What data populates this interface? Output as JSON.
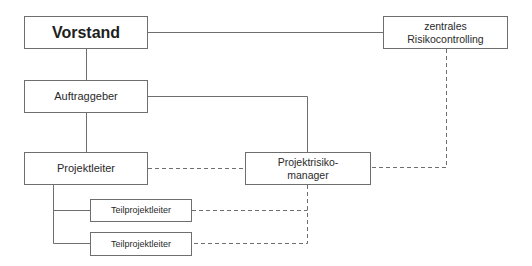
{
  "diagram": {
    "type": "organization-chart",
    "nodes": {
      "vorstand": {
        "label": "Vorstand"
      },
      "zentrales_risikocontrolling": {
        "line1": "zentrales",
        "line2": "Risikocontrolling"
      },
      "auftraggeber": {
        "label": "Auftraggeber"
      },
      "projektleiter": {
        "label": "Projektleiter"
      },
      "projektrisikomanager": {
        "line1": "Projektrisiko-",
        "line2": "manager"
      },
      "teilprojektleiter_1": {
        "label": "Teilprojektleiter"
      },
      "teilprojektleiter_2": {
        "label": "Teilprojektleiter"
      }
    },
    "edges": [
      {
        "from": "vorstand",
        "to": "zentrales_risikocontrolling",
        "style": "solid"
      },
      {
        "from": "vorstand",
        "to": "auftraggeber",
        "style": "solid"
      },
      {
        "from": "auftraggeber",
        "to": "projektleiter",
        "style": "solid"
      },
      {
        "from": "auftraggeber",
        "to": "projektrisikomanager",
        "style": "solid"
      },
      {
        "from": "projektleiter",
        "to": "teilprojektleiter_1",
        "style": "solid"
      },
      {
        "from": "projektleiter",
        "to": "teilprojektleiter_2",
        "style": "solid"
      },
      {
        "from": "projektleiter",
        "to": "projektrisikomanager",
        "style": "dashed"
      },
      {
        "from": "zentrales_risikocontrolling",
        "to": "projektrisikomanager",
        "style": "dashed"
      },
      {
        "from": "projektrisikomanager",
        "to": "teilprojektleiter_1",
        "style": "dashed"
      },
      {
        "from": "projektrisikomanager",
        "to": "teilprojektleiter_2",
        "style": "dashed"
      }
    ],
    "colors": {
      "line": "#6e6e6e",
      "box_border": "#6e6e6e",
      "text": "#2a2a2a",
      "background": "#ffffff"
    }
  }
}
